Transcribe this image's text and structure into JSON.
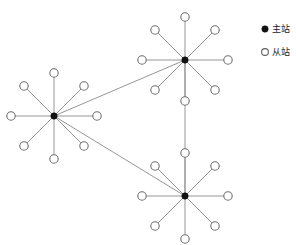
{
  "figure": {
    "title": "",
    "background_color": "#ffffff",
    "width": 296,
    "height": 245
  },
  "legend": {
    "position": "top-right",
    "items": [
      {
        "symbol": "filled-circle",
        "label": "主站",
        "color": "#111111"
      },
      {
        "symbol": "hollow-circle",
        "label": "从站",
        "color": "#ffffff"
      }
    ]
  },
  "chart_data": {
    "type": "scatter",
    "title": "",
    "xlabel": "",
    "ylabel": "",
    "grid": false,
    "legend_position": "top-right",
    "node_types": [
      {
        "key": "master",
        "label": "主站",
        "marker": "filled-circle",
        "count": 3
      },
      {
        "key": "slave",
        "label": "从站",
        "marker": "hollow-circle",
        "count": 24
      }
    ],
    "masters": [
      {
        "id": "M1",
        "name": "left-master",
        "x": 54,
        "y": 116,
        "slave_count": 8
      },
      {
        "id": "M2",
        "name": "top-master",
        "x": 185,
        "y": 60,
        "slave_count": 8
      },
      {
        "id": "M3",
        "name": "bottom-master",
        "x": 185,
        "y": 196,
        "slave_count": 8
      }
    ],
    "slaves": [
      {
        "id": "S1-1",
        "master": "M1",
        "x": 54,
        "y": 73
      },
      {
        "id": "S1-2",
        "master": "M1",
        "x": 84,
        "y": 86
      },
      {
        "id": "S1-3",
        "master": "M1",
        "x": 97,
        "y": 116
      },
      {
        "id": "S1-4",
        "master": "M1",
        "x": 84,
        "y": 146
      },
      {
        "id": "S1-5",
        "master": "M1",
        "x": 54,
        "y": 159
      },
      {
        "id": "S1-6",
        "master": "M1",
        "x": 24,
        "y": 146
      },
      {
        "id": "S1-7",
        "master": "M1",
        "x": 11,
        "y": 116
      },
      {
        "id": "S1-8",
        "master": "M1",
        "x": 24,
        "y": 86
      },
      {
        "id": "S2-1",
        "master": "M2",
        "x": 185,
        "y": 17
      },
      {
        "id": "S2-2",
        "master": "M2",
        "x": 215,
        "y": 30
      },
      {
        "id": "S2-3",
        "master": "M2",
        "x": 228,
        "y": 60
      },
      {
        "id": "S2-4",
        "master": "M2",
        "x": 215,
        "y": 90
      },
      {
        "id": "S2-5",
        "master": "M2",
        "x": 185,
        "y": 101
      },
      {
        "id": "S2-6",
        "master": "M2",
        "x": 155,
        "y": 90
      },
      {
        "id": "S2-7",
        "master": "M2",
        "x": 142,
        "y": 60
      },
      {
        "id": "S2-8",
        "master": "M2",
        "x": 155,
        "y": 30
      },
      {
        "id": "S3-1",
        "master": "M3",
        "x": 185,
        "y": 153
      },
      {
        "id": "S3-2",
        "master": "M3",
        "x": 215,
        "y": 166
      },
      {
        "id": "S3-3",
        "master": "M3",
        "x": 228,
        "y": 196
      },
      {
        "id": "S3-4",
        "master": "M3",
        "x": 215,
        "y": 226
      },
      {
        "id": "S3-5",
        "master": "M3",
        "x": 185,
        "y": 239
      },
      {
        "id": "S3-6",
        "master": "M3",
        "x": 155,
        "y": 226
      },
      {
        "id": "S3-7",
        "master": "M3",
        "x": 142,
        "y": 196
      },
      {
        "id": "S3-8",
        "master": "M3",
        "x": 155,
        "y": 166
      }
    ],
    "trunk_links": [
      {
        "from": "M1",
        "to": "M2"
      },
      {
        "from": "M1",
        "to": "M3"
      },
      {
        "from": "M2",
        "to": "M3"
      }
    ],
    "style": {
      "link_color": "#8a8a8a",
      "master_color": "#111111",
      "slave_stroke": "#6f6f6f",
      "slave_fill": "#ffffff",
      "master_radius": 3.2,
      "slave_radius": 4.2
    }
  }
}
